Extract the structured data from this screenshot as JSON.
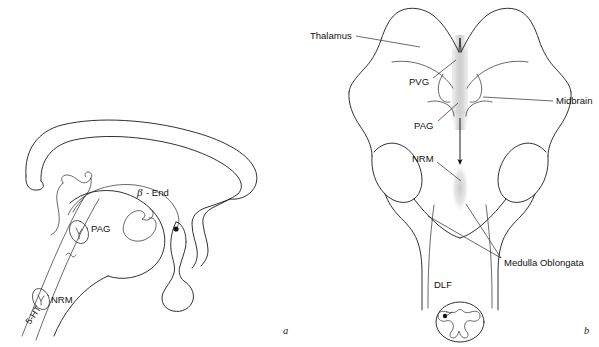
{
  "figure": {
    "background_color": "#ffffff",
    "line_color": "#1a1a1a",
    "shade_color": "#d9d9d9"
  },
  "panels": [
    {
      "id": "a",
      "letter": "a",
      "caption_position": "bottom-right",
      "description": "Midsagittal view of brain showing beta-endorphin and 5-HT pathways"
    },
    {
      "id": "b",
      "letter": "b",
      "caption_position": "bottom-right",
      "description": "Dorsal view of brainstem showing PVG, PAG, NRM and DLF"
    }
  ],
  "panel_a": {
    "labels": [
      {
        "key": "beta_end",
        "text": "- End",
        "greek": "β",
        "x": 137,
        "y": 196
      },
      {
        "key": "pag",
        "text": "PAG",
        "x": 91,
        "y": 232
      },
      {
        "key": "nrm",
        "text": "NRM",
        "x": 51,
        "y": 299
      },
      {
        "key": "five_ht",
        "text": "5-HT",
        "x": 30,
        "y": 325,
        "rotation": -55
      }
    ],
    "panel_letter": {
      "text": "a",
      "x": 283,
      "y": 334
    }
  },
  "panel_b": {
    "labels": [
      {
        "key": "thalamus",
        "text": "Thalamus",
        "x": 310,
        "y": 39,
        "anchor": "start"
      },
      {
        "key": "pvg",
        "text": "PVG",
        "x": 412,
        "y": 82,
        "anchor": "start"
      },
      {
        "key": "midbrain",
        "text": "Midbrain",
        "x": 556,
        "y": 101,
        "anchor": "start"
      },
      {
        "key": "pag",
        "text": "PAG",
        "x": 417,
        "y": 126,
        "anchor": "start"
      },
      {
        "key": "nrm",
        "text": "NRM",
        "x": 414,
        "y": 159,
        "anchor": "start"
      },
      {
        "key": "medulla_oblongata",
        "text": "Medulla Oblongata",
        "x": 504,
        "y": 263,
        "anchor": "start"
      },
      {
        "key": "dlf",
        "text": "DLF",
        "x": 434,
        "y": 285,
        "anchor": "start"
      }
    ],
    "panel_letter": {
      "text": "b",
      "x": 585,
      "y": 334
    }
  },
  "structures": {
    "panel_a": [
      "cerebral-cortex-outline",
      "corpus-callosum",
      "lateral-ventricle",
      "thalamus-hypothalamus",
      "pituitary",
      "brainstem-tract",
      "pag-nucleus-ellipse",
      "nrm-nucleus-ellipse",
      "beta-endorphin-arc",
      "beta-endorphin-terminal-dot"
    ],
    "panel_b": [
      "thalamus-left-lobe",
      "thalamus-right-lobe",
      "midbrain-colliculi",
      "cerebellar-peduncle-left",
      "cerebellar-peduncle-right",
      "medulla-oblongata",
      "spinal-cord-cross-section",
      "midline-pvg-pag-shading",
      "descending-arrow",
      "dlf-tract-lines"
    ]
  }
}
